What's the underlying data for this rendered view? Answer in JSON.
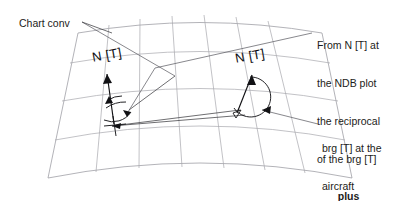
{
  "diagram": {
    "background_color": "#ffffff",
    "graticule_color": "#a8a8ad",
    "annotation_color": "#17171a"
  },
  "labels": {
    "chart_conv": "Chart conv",
    "north_ndb": "N [T]",
    "north_aircraft": "N [T]",
    "brg_aircraft": {
      "line1": "brg [T] at the",
      "line2": "aircraft"
    },
    "ndb_note": {
      "line1": "From N [T] at",
      "line2": "the NDB plot",
      "line3": "the reciprocal",
      "line4": "of the brg [T]",
      "line5": "plus",
      "line6": "chart conv"
    }
  },
  "markers": {
    "ndb_station": "ndb-cross-symbol",
    "aircraft_station": "aircraft-triangle-symbol",
    "bearing_arc_ndb": "convergence-angle-arc",
    "bearing_arc_aircraft": "bearing-angle-arc"
  }
}
